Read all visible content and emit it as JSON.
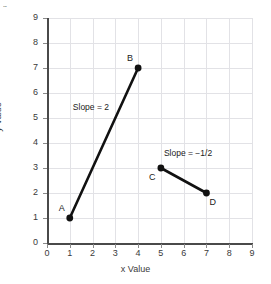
{
  "figure_mark": "...",
  "chart_data": {
    "type": "line",
    "title": "",
    "xlabel": "x Value",
    "ylabel": "y Value",
    "xlim": [
      0,
      9
    ],
    "ylim": [
      0,
      9
    ],
    "xticks": [
      0,
      1,
      2,
      3,
      4,
      5,
      6,
      7,
      8,
      9
    ],
    "yticks": [
      0,
      1,
      2,
      3,
      4,
      5,
      6,
      7,
      8,
      9
    ],
    "xtick_labels": [
      "0",
      "1",
      "2",
      "3",
      "4",
      "5",
      "6",
      "7",
      "8",
      "9"
    ],
    "ytick_labels": [
      "0",
      "1",
      "2",
      "3",
      "4",
      "5",
      "6",
      "7",
      "8",
      "9"
    ],
    "grid": true,
    "legend": "none",
    "series": [
      {
        "name": "Segment AB",
        "points": [
          {
            "label": "A",
            "x": 1,
            "y": 1
          },
          {
            "label": "B",
            "x": 4,
            "y": 7
          }
        ],
        "annotation": "Slope = 2",
        "slope": 2
      },
      {
        "name": "Segment CD",
        "points": [
          {
            "label": "C",
            "x": 5,
            "y": 3
          },
          {
            "label": "D",
            "x": 7,
            "y": 2
          }
        ],
        "annotation": "Slope = −1/2",
        "slope": -0.5
      }
    ],
    "annotations": [
      {
        "text": "Slope = 2",
        "x": 2.1,
        "y": 5.4
      },
      {
        "text": "Slope = −1/2",
        "x": 6.1,
        "y": 3.55
      }
    ],
    "point_labels": [
      {
        "text": "A",
        "x": 1,
        "y": 1,
        "placement": "upper-left"
      },
      {
        "text": "B",
        "x": 4,
        "y": 7,
        "placement": "upper-left"
      },
      {
        "text": "C",
        "x": 5,
        "y": 3,
        "placement": "lower-left"
      },
      {
        "text": "D",
        "x": 7,
        "y": 2,
        "placement": "lower-right"
      }
    ],
    "colors": {
      "line": "#111111",
      "marker": "#111111",
      "grid": "#e2e2e6",
      "axis": "#4a4a4a",
      "background": "#ffffff",
      "text": "#3a3a3a"
    }
  }
}
